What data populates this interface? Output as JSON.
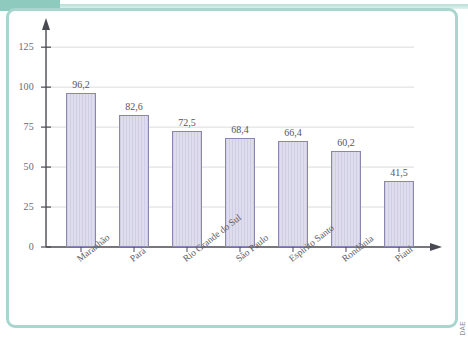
{
  "figure": {
    "frame_color": "#a8d6ce",
    "band_color": "#8fcabf",
    "credit": "DAE"
  },
  "chart_data": {
    "type": "bar",
    "title": "",
    "subtitle": "",
    "xlabel": "",
    "ylabel": "",
    "categories": [
      "Maranhão",
      "Pará",
      "Rio Grande do Sul",
      "São Paulo",
      "Espírito Santo",
      "Rondônia",
      "Piauí"
    ],
    "values": [
      96.2,
      82.6,
      72.5,
      68.4,
      66.4,
      60.2,
      41.5
    ],
    "value_labels": [
      "96,2",
      "82,6",
      "72,5",
      "68,4",
      "66,4",
      "60,2",
      "41,5"
    ],
    "ylim": [
      0,
      137
    ],
    "yticks": [
      0,
      25,
      50,
      75,
      100,
      125
    ],
    "ytick_labels": [
      "0",
      "25",
      "50",
      "75",
      "100",
      "125"
    ],
    "grid": true,
    "grid_axis": "y",
    "legend": null,
    "bar_fill": "#dedced",
    "bar_edge": "#8a86ad",
    "axis_color": "#4a4a52"
  }
}
